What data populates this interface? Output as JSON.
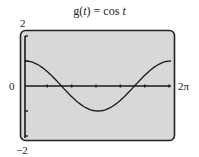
{
  "chart_data": {
    "type": "line",
    "title": "g(t) = cos t",
    "function": "cos t",
    "xlabel": "",
    "ylabel": "",
    "xlim": [
      0,
      6.2832
    ],
    "ylim": [
      -2,
      2
    ],
    "x_tick_labels": {
      "left": "0",
      "right": "2π"
    },
    "y_tick_labels": {
      "top": "2",
      "bottom": "-2"
    },
    "x_ticks": [
      1.0472,
      2.0944,
      3.1416,
      4.1888,
      5.236,
      6.2832
    ],
    "y_ticks": [
      -2,
      -1,
      1,
      2
    ],
    "grid": false,
    "legend": null,
    "series": [
      {
        "name": "g(t) = cos t",
        "x": [
          0,
          0.5236,
          1.0472,
          1.5708,
          2.0944,
          2.618,
          3.1416,
          3.6652,
          4.1888,
          4.7124,
          5.236,
          5.7596,
          6.2832
        ],
        "y": [
          1,
          0.866,
          0.5,
          0,
          -0.5,
          -0.866,
          -1,
          -0.866,
          -0.5,
          0,
          0.5,
          0.866,
          1
        ]
      }
    ]
  },
  "labels": {
    "title_prefix": "g(",
    "title_var": "t",
    "title_mid": ") = cos ",
    "title_var2": "t",
    "y_top": "2",
    "y_bottom": "−2",
    "x_left": "0",
    "x_right": "2π"
  },
  "colors": {
    "screen_fill": "#d8d8d8",
    "frame": "#222222",
    "curve": "#1a1a1a"
  }
}
